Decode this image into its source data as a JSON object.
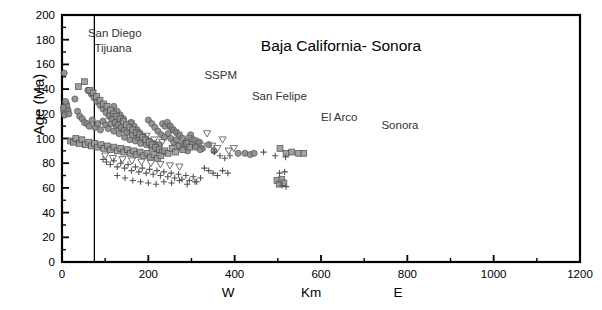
{
  "chart_data": {
    "type": "scatter",
    "title": "Baja California- Sonora",
    "xlabel_center": "Km",
    "xlabel_west": "W",
    "xlabel_east": "E",
    "ylabel": "Age (Ma)",
    "xlim": [
      0,
      1200
    ],
    "ylim": [
      0,
      200
    ],
    "xticks": [
      0,
      200,
      400,
      600,
      800,
      1000,
      1200
    ],
    "xtick_labels": [
      "0",
      "200",
      "400",
      "600",
      "800",
      "1000",
      "1200"
    ],
    "xminor_step": 100,
    "yticks": [
      0,
      20,
      40,
      60,
      80,
      100,
      120,
      140,
      160,
      180,
      200
    ],
    "ytick_labels": [
      "0",
      "20",
      "40",
      "60",
      "80",
      "100",
      "120",
      "140",
      "160",
      "180",
      "200"
    ],
    "yminor_step": 10,
    "grid": false,
    "legend": "none",
    "reference_line": {
      "orientation": "vertical",
      "x": 75,
      "color": "#000000"
    },
    "annotations": [
      {
        "text": "San  Diego",
        "x": 60,
        "y": 182
      },
      {
        "text": "Tijuana",
        "x": 75,
        "y": 170
      },
      {
        "text": "SSPM",
        "x": 330,
        "y": 148
      },
      {
        "text": "San Felipe",
        "x": 440,
        "y": 131
      },
      {
        "text": "El Arco",
        "x": 600,
        "y": 114
      },
      {
        "text": "Sonora",
        "x": 740,
        "y": 108
      }
    ],
    "marker_colors": {
      "circle": "#8c8c8c",
      "square": "#9a9a9a",
      "triangle": "#6f6f6f",
      "plus": "#555555",
      "outline": "#4a4a4a"
    },
    "series": [
      {
        "name": "circles",
        "marker": "circle",
        "points": [
          [
            5,
            153
          ],
          [
            10,
            128
          ],
          [
            7,
            126
          ],
          [
            12,
            124
          ],
          [
            4,
            122
          ],
          [
            9,
            121
          ],
          [
            14,
            123
          ],
          [
            6,
            119
          ],
          [
            11,
            127
          ],
          [
            3,
            125
          ],
          [
            16,
            120
          ],
          [
            8,
            130
          ],
          [
            30,
            132
          ],
          [
            36,
            122
          ],
          [
            41,
            118
          ],
          [
            47,
            116
          ],
          [
            52,
            113
          ],
          [
            58,
            112
          ],
          [
            63,
            110
          ],
          [
            70,
            115
          ],
          [
            76,
            109
          ],
          [
            83,
            112
          ],
          [
            89,
            107
          ],
          [
            95,
            114
          ],
          [
            101,
            111
          ],
          [
            107,
            108
          ],
          [
            113,
            112
          ],
          [
            120,
            106
          ],
          [
            126,
            110
          ],
          [
            132,
            104
          ],
          [
            138,
            108
          ],
          [
            145,
            101
          ],
          [
            151,
            105
          ],
          [
            157,
            99
          ],
          [
            163,
            103
          ],
          [
            170,
            98
          ],
          [
            176,
            101
          ],
          [
            182,
            96
          ],
          [
            188,
            100
          ],
          [
            195,
            95
          ],
          [
            201,
            98
          ],
          [
            207,
            93
          ],
          [
            214,
            96
          ],
          [
            220,
            91
          ],
          [
            226,
            95
          ],
          [
            233,
            112
          ],
          [
            239,
            110
          ],
          [
            246,
            104
          ],
          [
            252,
            100
          ],
          [
            259,
            97
          ],
          [
            265,
            99
          ],
          [
            272,
            94
          ],
          [
            278,
            92
          ],
          [
            285,
            96
          ],
          [
            291,
            90
          ],
          [
            298,
            103
          ],
          [
            305,
            99
          ],
          [
            312,
            94
          ],
          [
            318,
            97
          ],
          [
            325,
            92
          ],
          [
            60,
            139
          ],
          [
            68,
            136
          ],
          [
            74,
            133
          ],
          [
            81,
            130
          ],
          [
            88,
            127
          ],
          [
            95,
            124
          ],
          [
            102,
            121
          ],
          [
            109,
            118
          ],
          [
            116,
            116
          ],
          [
            123,
            113
          ],
          [
            130,
            111
          ],
          [
            137,
            109
          ],
          [
            144,
            107
          ],
          [
            150,
            105
          ],
          [
            120,
            126
          ],
          [
            128,
            122
          ],
          [
            135,
            119
          ],
          [
            142,
            116
          ],
          [
            160,
            113
          ],
          [
            167,
            110
          ],
          [
            174,
            107
          ],
          [
            180,
            104
          ],
          [
            187,
            102
          ],
          [
            193,
            100
          ],
          [
            200,
            115
          ],
          [
            208,
            112
          ],
          [
            215,
            109
          ],
          [
            222,
            106
          ],
          [
            230,
            103
          ],
          [
            237,
            101
          ],
          [
            244,
            113
          ],
          [
            251,
            110
          ],
          [
            258,
            107
          ],
          [
            265,
            105
          ],
          [
            273,
            102
          ],
          [
            280,
            100
          ],
          [
            290,
            98
          ],
          [
            300,
            95
          ],
          [
            310,
            93
          ],
          [
            320,
            91
          ],
          [
            340,
            95
          ],
          [
            352,
            90
          ],
          [
            408,
            88
          ],
          [
            424,
            88
          ],
          [
            436,
            87
          ],
          [
            445,
            88
          ]
        ]
      },
      {
        "name": "squares",
        "marker": "square",
        "points": [
          [
            38,
            142
          ],
          [
            52,
            146
          ],
          [
            64,
            139
          ],
          [
            72,
            137
          ],
          [
            80,
            134
          ],
          [
            88,
            131
          ],
          [
            96,
            128
          ],
          [
            104,
            126
          ],
          [
            112,
            123
          ],
          [
            119,
            120
          ],
          [
            127,
            118
          ],
          [
            134,
            116
          ],
          [
            142,
            114
          ],
          [
            149,
            111
          ],
          [
            157,
            109
          ],
          [
            164,
            107
          ],
          [
            172,
            105
          ],
          [
            179,
            103
          ],
          [
            187,
            101
          ],
          [
            194,
            99
          ],
          [
            202,
            97
          ],
          [
            209,
            95
          ],
          [
            217,
            93
          ],
          [
            225,
            91
          ],
          [
            232,
            89
          ],
          [
            20,
            98
          ],
          [
            26,
            97
          ],
          [
            32,
            100
          ],
          [
            40,
            96
          ],
          [
            46,
            99
          ],
          [
            54,
            95
          ],
          [
            62,
            97
          ],
          [
            68,
            94
          ],
          [
            75,
            96
          ],
          [
            82,
            93
          ],
          [
            90,
            95
          ],
          [
            97,
            92
          ],
          [
            105,
            94
          ],
          [
            112,
            91
          ],
          [
            120,
            93
          ],
          [
            128,
            90
          ],
          [
            136,
            92
          ],
          [
            143,
            89
          ],
          [
            151,
            91
          ],
          [
            158,
            88
          ],
          [
            166,
            90
          ],
          [
            173,
            87
          ],
          [
            181,
            89
          ],
          [
            189,
            86
          ],
          [
            197,
            88
          ],
          [
            205,
            85
          ],
          [
            213,
            87
          ],
          [
            221,
            84
          ],
          [
            229,
            86
          ],
          [
            238,
            90
          ],
          [
            246,
            88
          ],
          [
            255,
            92
          ],
          [
            263,
            89
          ],
          [
            271,
            94
          ],
          [
            280,
            91
          ],
          [
            288,
            96
          ],
          [
            296,
            93
          ],
          [
            505,
            92
          ],
          [
            519,
            88
          ],
          [
            532,
            89
          ],
          [
            548,
            88
          ],
          [
            560,
            88
          ],
          [
            498,
            66
          ],
          [
            503,
            63
          ],
          [
            509,
            67
          ],
          [
            514,
            64
          ]
        ]
      },
      {
        "name": "triangles",
        "marker": "triangle",
        "points": [
          [
            110,
            118
          ],
          [
            135,
            116
          ],
          [
            160,
            112
          ],
          [
            178,
            104
          ],
          [
            196,
            102
          ],
          [
            214,
            99
          ],
          [
            232,
            97
          ],
          [
            246,
            110
          ],
          [
            254,
            107
          ],
          [
            262,
            105
          ],
          [
            270,
            103
          ],
          [
            278,
            95
          ],
          [
            286,
            93
          ],
          [
            296,
            100
          ],
          [
            308,
            98
          ],
          [
            316,
            96
          ],
          [
            324,
            94
          ],
          [
            336,
            104
          ],
          [
            348,
            94
          ],
          [
            360,
            92
          ],
          [
            372,
            99
          ],
          [
            386,
            90
          ],
          [
            398,
            92
          ],
          [
            100,
            86
          ],
          [
            118,
            84
          ],
          [
            140,
            83
          ],
          [
            162,
            82
          ],
          [
            184,
            81
          ],
          [
            206,
            80
          ],
          [
            228,
            79
          ],
          [
            250,
            78
          ],
          [
            272,
            77
          ]
        ]
      },
      {
        "name": "pluses",
        "marker": "plus",
        "points": [
          [
            95,
            83
          ],
          [
            103,
            81
          ],
          [
            112,
            79
          ],
          [
            120,
            82
          ],
          [
            128,
            77
          ],
          [
            136,
            80
          ],
          [
            145,
            76
          ],
          [
            153,
            79
          ],
          [
            161,
            74
          ],
          [
            170,
            77
          ],
          [
            178,
            73
          ],
          [
            186,
            76
          ],
          [
            195,
            72
          ],
          [
            203,
            75
          ],
          [
            211,
            71
          ],
          [
            220,
            74
          ],
          [
            228,
            70
          ],
          [
            236,
            73
          ],
          [
            245,
            69
          ],
          [
            253,
            72
          ],
          [
            261,
            68
          ],
          [
            270,
            71
          ],
          [
            278,
            67
          ],
          [
            287,
            70
          ],
          [
            295,
            66
          ],
          [
            304,
            69
          ],
          [
            312,
            65
          ],
          [
            321,
            68
          ],
          [
            330,
            76
          ],
          [
            340,
            74
          ],
          [
            350,
            72
          ],
          [
            360,
            70
          ],
          [
            372,
            74
          ],
          [
            384,
            72
          ],
          [
            128,
            70
          ],
          [
            146,
            68
          ],
          [
            164,
            66
          ],
          [
            182,
            65
          ],
          [
            200,
            64
          ],
          [
            218,
            63
          ],
          [
            236,
            65
          ],
          [
            254,
            64
          ],
          [
            272,
            66
          ],
          [
            290,
            63
          ],
          [
            308,
            65
          ],
          [
            467,
            89
          ],
          [
            494,
            86
          ],
          [
            518,
            85
          ],
          [
            504,
            72
          ],
          [
            516,
            73
          ],
          [
            510,
            62
          ],
          [
            519,
            61
          ],
          [
            353,
            89
          ],
          [
            366,
            86
          ],
          [
            377,
            84
          ],
          [
            389,
            86
          ]
        ]
      }
    ]
  }
}
